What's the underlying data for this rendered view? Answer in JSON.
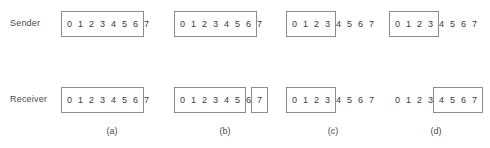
{
  "figure": {
    "row_labels": {
      "sender": "Sender",
      "receiver": "Receiver"
    },
    "sequence_digits": [
      "0",
      "1",
      "2",
      "3",
      "4",
      "5",
      "6",
      "7"
    ],
    "box_color": "#8c8c8c",
    "text_color": "#3a3a3a",
    "background": "#ffffff",
    "panels": [
      {
        "caption": "(a)",
        "sender": {
          "digits": [
            "0",
            "1",
            "2",
            "3",
            "4",
            "5",
            "6",
            "7"
          ],
          "windows": [
            {
              "start": 0,
              "end": 6
            }
          ]
        },
        "receiver": {
          "digits": [
            "0",
            "1",
            "2",
            "3",
            "4",
            "5",
            "6",
            "7"
          ],
          "windows": [
            {
              "start": 0,
              "end": 6
            }
          ]
        }
      },
      {
        "caption": "(b)",
        "sender": {
          "digits": [
            "0",
            "1",
            "2",
            "3",
            "4",
            "5",
            "6",
            "7"
          ],
          "windows": [
            {
              "start": 0,
              "end": 6
            }
          ]
        },
        "receiver": {
          "digits": [
            "0",
            "1",
            "2",
            "3",
            "4",
            "5",
            "6",
            "7"
          ],
          "windows": [
            {
              "start": 0,
              "end": 5
            },
            {
              "start": 7,
              "end": 7
            }
          ]
        }
      },
      {
        "caption": "(c)",
        "sender": {
          "digits": [
            "0",
            "1",
            "2",
            "3",
            "4",
            "5",
            "6",
            "7"
          ],
          "windows": [
            {
              "start": 0,
              "end": 3
            }
          ]
        },
        "receiver": {
          "digits": [
            "0",
            "1",
            "2",
            "3",
            "4",
            "5",
            "6",
            "7"
          ],
          "windows": [
            {
              "start": 0,
              "end": 3
            }
          ]
        }
      },
      {
        "caption": "(d)",
        "sender": {
          "digits": [
            "0",
            "1",
            "2",
            "3",
            "4",
            "5",
            "6",
            "7"
          ],
          "windows": [
            {
              "start": 0,
              "end": 3
            }
          ]
        },
        "receiver": {
          "digits": [
            "0",
            "1",
            "2",
            "3",
            "4",
            "5",
            "6",
            "7"
          ],
          "windows": [
            {
              "start": 4,
              "end": 7
            }
          ]
        }
      }
    ],
    "layout": {
      "panel_left_positions": [
        64,
        177,
        289,
        392
      ],
      "cell_width": 11,
      "caption_offsets": [
        48,
        48,
        44,
        44
      ]
    }
  }
}
